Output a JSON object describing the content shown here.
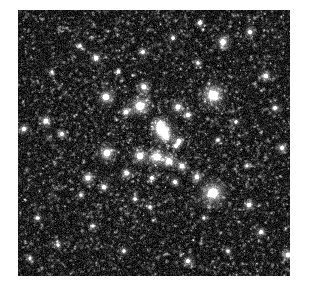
{
  "image": {
    "kind": "astronomical-photograph",
    "subject": "open star cluster field",
    "color_mode": "grayscale",
    "canvas_width": 309,
    "canvas_height": 289,
    "margin_color": "#ffffff",
    "field": {
      "x": 18,
      "y": 10,
      "width": 272,
      "height": 266
    },
    "background": {
      "base_color": "#050505",
      "noise_mean": 26,
      "noise_sigma": 20,
      "noise_cell": 1,
      "faint_star_count": 5200,
      "faint_star_min_brightness": 40,
      "faint_star_max_brightness": 150,
      "vignette_strength": 0.12,
      "seed": 20240917
    },
    "stars": [
      {
        "x": 213,
        "y": 95,
        "r": 5.2,
        "i": 255,
        "name": "bright-star-upper-right"
      },
      {
        "x": 213,
        "y": 193,
        "r": 5.6,
        "i": 255,
        "name": "bright-star-lower-right"
      },
      {
        "x": 140,
        "y": 106,
        "r": 4.6,
        "i": 252,
        "name": "bright-star-cluster-north"
      },
      {
        "x": 163,
        "y": 131,
        "r": 4.8,
        "i": 255,
        "name": "bright-double-star-core"
      },
      {
        "x": 160,
        "y": 125,
        "r": 3.4,
        "i": 240,
        "name": "bright-star-core-companion"
      },
      {
        "x": 166,
        "y": 137,
        "r": 3.0,
        "i": 232,
        "name": "bright-star-core-south"
      },
      {
        "x": 157,
        "y": 157,
        "r": 4.2,
        "i": 250,
        "name": "bright-star-cluster-center"
      },
      {
        "x": 140,
        "y": 156,
        "r": 3.6,
        "i": 238,
        "name": "star-center-west"
      },
      {
        "x": 169,
        "y": 161,
        "r": 3.2,
        "i": 234,
        "name": "star-center-east"
      },
      {
        "x": 107,
        "y": 153,
        "r": 3.8,
        "i": 244,
        "name": "star-mid-west"
      },
      {
        "x": 106,
        "y": 97,
        "r": 3.6,
        "i": 240,
        "name": "star-northwest-cluster"
      },
      {
        "x": 126,
        "y": 112,
        "r": 2.6,
        "i": 215,
        "name": "star-nw-faintish"
      },
      {
        "x": 144,
        "y": 87,
        "r": 2.9,
        "i": 222,
        "name": "star-north-a"
      },
      {
        "x": 178,
        "y": 107,
        "r": 3.0,
        "i": 228,
        "name": "star-north-b"
      },
      {
        "x": 188,
        "y": 115,
        "r": 2.5,
        "i": 210,
        "name": "star-north-c"
      },
      {
        "x": 179,
        "y": 141,
        "r": 2.6,
        "i": 214,
        "name": "star-east-a"
      },
      {
        "x": 176,
        "y": 146,
        "r": 2.2,
        "i": 200,
        "name": "star-east-b"
      },
      {
        "x": 182,
        "y": 166,
        "r": 2.8,
        "i": 220,
        "name": "star-east-c"
      },
      {
        "x": 127,
        "y": 173,
        "r": 2.4,
        "i": 205,
        "name": "star-south-a"
      },
      {
        "x": 152,
        "y": 178,
        "r": 2.2,
        "i": 198,
        "name": "star-south-b"
      },
      {
        "x": 135,
        "y": 199,
        "r": 2.0,
        "i": 192,
        "name": "star-south-c"
      },
      {
        "x": 175,
        "y": 182,
        "r": 2.3,
        "i": 202,
        "name": "star-south-d"
      },
      {
        "x": 197,
        "y": 177,
        "r": 2.6,
        "i": 212,
        "name": "star-southeast-a"
      },
      {
        "x": 150,
        "y": 207,
        "r": 2.0,
        "i": 188,
        "name": "star-lower-a"
      },
      {
        "x": 104,
        "y": 187,
        "r": 2.4,
        "i": 206,
        "name": "star-lower-west"
      },
      {
        "x": 88,
        "y": 178,
        "r": 3.0,
        "i": 228,
        "name": "star-west-lower"
      },
      {
        "x": 81,
        "y": 195,
        "r": 2.0,
        "i": 190,
        "name": "star-west-lower-b"
      },
      {
        "x": 46,
        "y": 121,
        "r": 2.8,
        "i": 222,
        "name": "star-far-west"
      },
      {
        "x": 24,
        "y": 129,
        "r": 2.4,
        "i": 210,
        "name": "star-edge-west"
      },
      {
        "x": 62,
        "y": 134,
        "r": 2.1,
        "i": 196,
        "name": "star-west-mid"
      },
      {
        "x": 96,
        "y": 58,
        "r": 2.6,
        "i": 215,
        "name": "star-upper-west"
      },
      {
        "x": 80,
        "y": 46,
        "r": 2.0,
        "i": 190,
        "name": "star-upper-west-b"
      },
      {
        "x": 143,
        "y": 52,
        "r": 2.2,
        "i": 198,
        "name": "star-top-a"
      },
      {
        "x": 173,
        "y": 38,
        "r": 2.0,
        "i": 192,
        "name": "star-top-b"
      },
      {
        "x": 223,
        "y": 42,
        "r": 3.2,
        "i": 234,
        "name": "star-top-right"
      },
      {
        "x": 250,
        "y": 32,
        "r": 2.4,
        "i": 206,
        "name": "star-top-right-b"
      },
      {
        "x": 200,
        "y": 23,
        "r": 2.1,
        "i": 194,
        "name": "star-top-c"
      },
      {
        "x": 266,
        "y": 76,
        "r": 2.6,
        "i": 214,
        "name": "star-right-upper"
      },
      {
        "x": 275,
        "y": 108,
        "r": 2.2,
        "i": 198,
        "name": "star-right-mid"
      },
      {
        "x": 282,
        "y": 148,
        "r": 2.4,
        "i": 204,
        "name": "star-right-lower"
      },
      {
        "x": 249,
        "y": 205,
        "r": 2.6,
        "i": 214,
        "name": "star-right-bottom-a"
      },
      {
        "x": 261,
        "y": 232,
        "r": 2.2,
        "i": 198,
        "name": "star-right-bottom-b"
      },
      {
        "x": 288,
        "y": 255,
        "r": 2.8,
        "i": 218,
        "name": "star-corner-bottom-right"
      },
      {
        "x": 228,
        "y": 251,
        "r": 2.0,
        "i": 188,
        "name": "star-bottom-right"
      },
      {
        "x": 188,
        "y": 261,
        "r": 2.4,
        "i": 206,
        "name": "star-bottom-center"
      },
      {
        "x": 124,
        "y": 251,
        "r": 2.0,
        "i": 190,
        "name": "star-bottom-left-a"
      },
      {
        "x": 58,
        "y": 245,
        "r": 1.9,
        "i": 184,
        "name": "star-bottom-left-b"
      },
      {
        "x": 38,
        "y": 218,
        "r": 2.0,
        "i": 188,
        "name": "star-bottom-far-left"
      },
      {
        "x": 30,
        "y": 258,
        "r": 1.8,
        "i": 178,
        "name": "star-corner-bottom-left"
      },
      {
        "x": 93,
        "y": 226,
        "r": 1.9,
        "i": 182,
        "name": "star-lower-mid"
      },
      {
        "x": 218,
        "y": 140,
        "r": 2.0,
        "i": 188,
        "name": "star-east-mid"
      },
      {
        "x": 236,
        "y": 122,
        "r": 1.9,
        "i": 182,
        "name": "star-east-upper"
      },
      {
        "x": 198,
        "y": 63,
        "r": 2.0,
        "i": 186,
        "name": "star-upper-mid"
      },
      {
        "x": 118,
        "y": 72,
        "r": 1.9,
        "i": 182,
        "name": "star-upper-left-mid"
      },
      {
        "x": 52,
        "y": 72,
        "r": 1.8,
        "i": 176,
        "name": "star-upper-far-left"
      },
      {
        "x": 247,
        "y": 166,
        "r": 1.8,
        "i": 176,
        "name": "star-right-center"
      },
      {
        "x": 204,
        "y": 218,
        "r": 1.8,
        "i": 174,
        "name": "star-lower-right-mid"
      }
    ]
  },
  "a11y": {
    "alt_text": "Grayscale astronomical image showing a dense field of stars with a loose central cluster of bright stars"
  }
}
